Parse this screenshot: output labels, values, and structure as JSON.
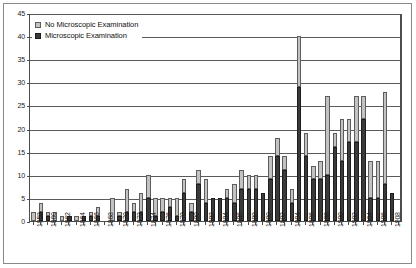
{
  "chart_data": {
    "type": "bar",
    "barmode": "stacked",
    "title": "",
    "subtitle": "",
    "xlabel": "",
    "ylabel": "",
    "ylim": [
      0,
      45
    ],
    "ytick_step": 5,
    "ytick_labels": [
      "0",
      "5",
      "10",
      "15",
      "20",
      "25",
      "30",
      "35",
      "40",
      "45"
    ],
    "grid": true,
    "grid_axis": "y",
    "legend": {
      "position": "top-left-inside",
      "entries": [
        {
          "name": "No Microscopic Examination",
          "color": "#c2c2c2"
        },
        {
          "name": "Microscopic Examination",
          "color": "#3a3a3a"
        }
      ]
    },
    "x_tick_label_every": 2,
    "x_tick_label_rotation": -90,
    "categories": [
      "1858",
      "1859",
      "1860",
      "1861",
      "1862",
      "1863",
      "1864",
      "1865",
      "1866",
      "1867",
      "1868",
      "1869",
      "1870",
      "1871",
      "1872",
      "1873",
      "1874",
      "1875",
      "1876",
      "1877",
      "1878",
      "1879",
      "1880",
      "1881",
      "1882",
      "1883",
      "1884",
      "1885",
      "1886",
      "1887",
      "1888",
      "1889",
      "1890",
      "1891",
      "1892",
      "1893",
      "1894",
      "1895",
      "1896",
      "1897",
      "1898",
      "1899",
      "1900",
      "1901",
      "1902",
      "1903",
      "1904",
      "1905",
      "1906",
      "1907",
      "1908",
      "1909"
    ],
    "x_tick_labels_shown": [
      "1858",
      "1860",
      "1862",
      "1864",
      "1866",
      "1868",
      "1870",
      "1872",
      "1874",
      "1876",
      "1878",
      "1880",
      "1882",
      "1884",
      "1886",
      "1888",
      "1890",
      "1892",
      "1894",
      "1896",
      "1898",
      "1900",
      "1902",
      "1904",
      "1906",
      "1908"
    ],
    "series": [
      {
        "name": "Microscopic Examination",
        "color": "#3a3a3a",
        "values": [
          0,
          2,
          1,
          0,
          0,
          1,
          0,
          1,
          1,
          1,
          0,
          0,
          1,
          2,
          2,
          2,
          5,
          1,
          2,
          3,
          1,
          6,
          2,
          8,
          4,
          5,
          5,
          5,
          4,
          7,
          7,
          7,
          6,
          9,
          14,
          11,
          4,
          29,
          14,
          9,
          9,
          10,
          16,
          13,
          17,
          17,
          22,
          5,
          5,
          8,
          6,
          0
        ]
      },
      {
        "name": "No Microscopic Examination",
        "color": "#c2c2c2",
        "values": [
          2,
          2,
          1,
          2,
          1,
          0,
          1,
          0,
          1,
          2,
          0,
          5,
          1,
          5,
          2,
          4,
          5,
          4,
          3,
          2,
          4,
          3,
          2,
          3,
          5,
          0,
          0,
          2,
          4,
          4,
          3,
          3,
          0,
          5,
          4,
          3,
          3,
          11,
          5,
          3,
          4,
          17,
          3,
          9,
          5,
          10,
          5,
          8,
          8,
          20,
          0,
          0
        ]
      }
    ],
    "totals": [
      2,
      4,
      2,
      2,
      1,
      1,
      1,
      1,
      2,
      3,
      0,
      5,
      2,
      7,
      4,
      6,
      10,
      5,
      5,
      5,
      5,
      9,
      4,
      11,
      9,
      5,
      5,
      7,
      8,
      11,
      10,
      10,
      6,
      14,
      18,
      14,
      7,
      40,
      19,
      12,
      13,
      27,
      19,
      22,
      26,
      27,
      27,
      13,
      13,
      28,
      6,
      0
    ]
  }
}
